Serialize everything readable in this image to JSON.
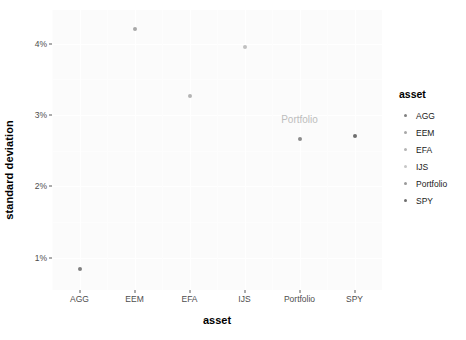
{
  "chart_data": {
    "type": "scatter",
    "title": "",
    "xlabel": "asset",
    "ylabel": "standard deviation",
    "categories": [
      "AGG",
      "EEM",
      "EFA",
      "IJS",
      "Portfolio",
      "SPY"
    ],
    "values": [
      0.0085,
      0.0421,
      0.0326,
      0.0395,
      0.0266,
      0.0271
    ],
    "points": [
      {
        "asset": "AGG",
        "standard_deviation": 0.0085,
        "label": "0.85%",
        "color": "#808080"
      },
      {
        "asset": "EEM",
        "standard_deviation": 0.0421,
        "label": "4.21%",
        "color": "#a8a8a8"
      },
      {
        "asset": "EFA",
        "standard_deviation": 0.0326,
        "label": "3.26%",
        "color": "#b4b4b4"
      },
      {
        "asset": "IJS",
        "standard_deviation": 0.0395,
        "label": "3.95%",
        "color": "#c0c0c0"
      },
      {
        "asset": "Portfolio",
        "standard_deviation": 0.0266,
        "label": "2.66%",
        "color": "#8c8c8c"
      },
      {
        "asset": "SPY",
        "standard_deviation": 0.0271,
        "label": "2.71%",
        "color": "#6e6e6e"
      }
    ],
    "annotations": [
      {
        "text": "Portfolio",
        "asset": "Portfolio",
        "standard_deviation": 0.0295,
        "color": "#bdbdbd"
      }
    ],
    "y_ticks": [
      {
        "value": 0.01,
        "label": "1%"
      },
      {
        "value": 0.02,
        "label": "2%"
      },
      {
        "value": 0.03,
        "label": "3%"
      },
      {
        "value": 0.04,
        "label": "4%"
      }
    ],
    "ylim": [
      0.0055,
      0.0447
    ],
    "grid": true,
    "legend": {
      "title": "asset",
      "position": "right",
      "entries": [
        {
          "label": "AGG",
          "color": "#808080"
        },
        {
          "label": "EEM",
          "color": "#a8a8a8"
        },
        {
          "label": "EFA",
          "color": "#b4b4b4"
        },
        {
          "label": "IJS",
          "color": "#c6c6c6"
        },
        {
          "label": "Portfolio",
          "color": "#9a9a9a"
        },
        {
          "label": "SPY",
          "color": "#6e6e6e"
        }
      ]
    },
    "panel_background": "#fbfbfb",
    "grid_color": "#ffffff"
  }
}
